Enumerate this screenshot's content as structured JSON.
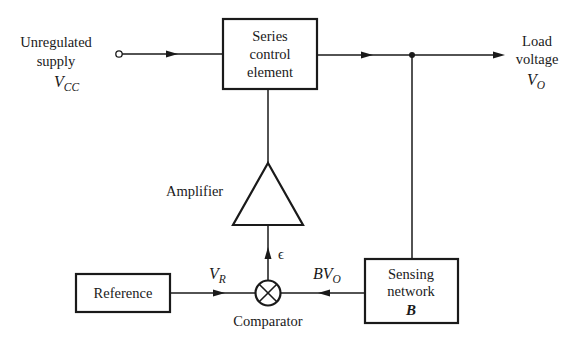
{
  "diagram": {
    "type": "block-diagram",
    "input": {
      "label_line1": "Unregulated",
      "label_line2": "supply",
      "symbol_main": "V",
      "symbol_sub": "CC"
    },
    "output": {
      "label_line1": "Load",
      "label_line2": "voltage",
      "symbol_main": "V",
      "symbol_sub": "O"
    },
    "blocks": {
      "series_control": {
        "line1": "Series",
        "line2": "control",
        "line3": "element"
      },
      "amplifier": {
        "label": "Amplifier"
      },
      "comparator": {
        "label": "Comparator"
      },
      "reference": {
        "label": "Reference"
      },
      "sensing": {
        "line1": "Sensing",
        "line2": "network",
        "line3": "B"
      }
    },
    "signals": {
      "reference_voltage": {
        "main": "V",
        "sub": "R"
      },
      "feedback": {
        "main": "BV",
        "sub": "O"
      },
      "error": "ϵ"
    },
    "colors": {
      "stroke": "#1a1a1a",
      "background": "#ffffff"
    }
  }
}
